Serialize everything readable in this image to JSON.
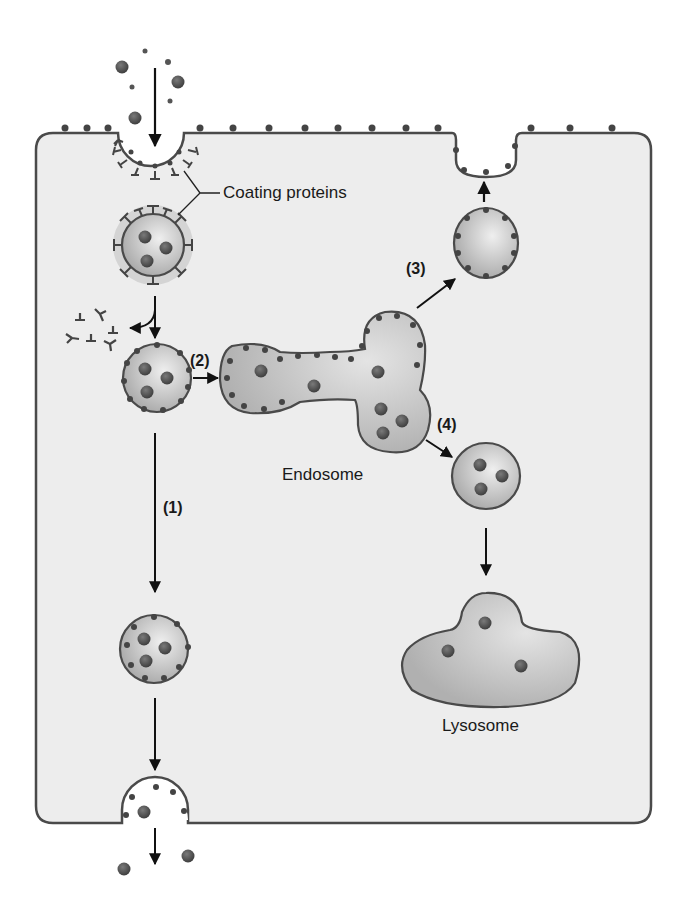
{
  "diagram": {
    "type": "cell-transport",
    "colors": {
      "cell_fill": "#ededed",
      "membrane": "#4a4a4a",
      "vesicle_fill": "#b5b5b5",
      "particle": "#4d4d4d",
      "arrow": "#111111"
    }
  },
  "labels": {
    "coating_proteins": "Coating proteins",
    "endosome": "Endosome",
    "lysosome": "Lysosome",
    "step1": "(1)",
    "step2": "(2)",
    "step3": "(3)",
    "step4": "(4)"
  }
}
